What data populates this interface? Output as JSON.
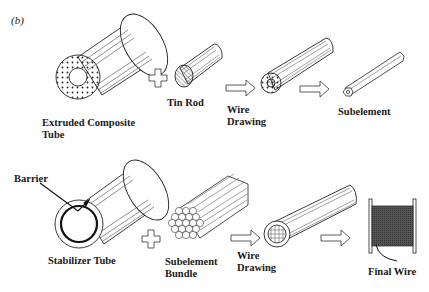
{
  "figure": {
    "panel_label": "(b)",
    "row1": {
      "items": [
        {
          "id": "extruded-composite-tube",
          "label_line1": "Extruded Composite",
          "label_line2": "Tube"
        },
        {
          "id": "plus",
          "symbol": "plus"
        },
        {
          "id": "tin-rod",
          "label_line1": "Tin Rod"
        },
        {
          "id": "arrow",
          "symbol": "arrow-right"
        },
        {
          "id": "wire-drawing",
          "label_line1": "Wire",
          "label_line2": "Drawing"
        },
        {
          "id": "arrow",
          "symbol": "arrow-right"
        },
        {
          "id": "subelement",
          "label_line1": "Subelement"
        }
      ]
    },
    "row2": {
      "items": [
        {
          "id": "stabilizer-tube",
          "label_line1": "Stabilizer Tube",
          "callout": "Barrier"
        },
        {
          "id": "plus",
          "symbol": "plus"
        },
        {
          "id": "subelement-bundle",
          "label_line1": "Subelement",
          "label_line2": "Bundle"
        },
        {
          "id": "arrow",
          "symbol": "arrow-right"
        },
        {
          "id": "wire-drawing",
          "label_line1": "Wire",
          "label_line2": "Drawing"
        },
        {
          "id": "arrow",
          "symbol": "arrow-right"
        },
        {
          "id": "final-wire",
          "label_line1": "Final Wire"
        }
      ]
    }
  },
  "colors": {
    "line": "#222222",
    "spool_fill": "#4a4a4a",
    "background": "#ffffff"
  }
}
